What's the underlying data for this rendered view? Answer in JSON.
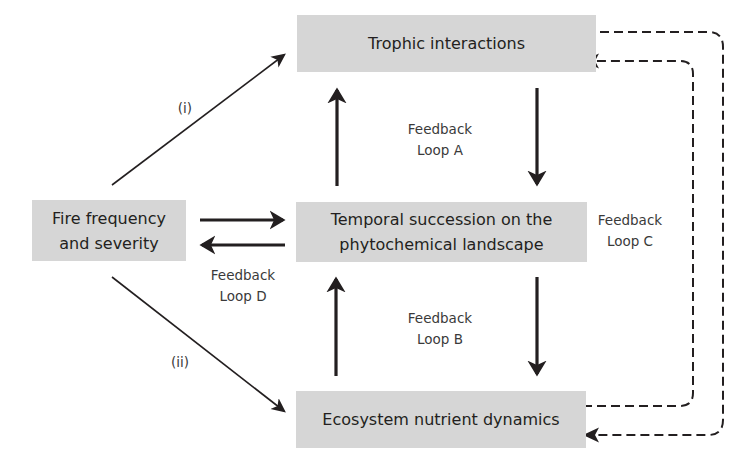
{
  "diagram": {
    "nodes": {
      "trophic": {
        "label": "Trophic interactions"
      },
      "temporal": {
        "line1": "Temporal succession on the",
        "line2": "phytochemical landscape"
      },
      "ecosystem": {
        "label": "Ecosystem nutrient dynamics"
      },
      "fire": {
        "line1": "Fire frequency",
        "line2": "and severity"
      }
    },
    "loops": {
      "a": {
        "line1": "Feedback",
        "line2": "Loop A"
      },
      "b": {
        "line1": "Feedback",
        "line2": "Loop B"
      },
      "c": {
        "line1": "Feedback",
        "line2": "Loop C"
      },
      "d": {
        "line1": "Feedback",
        "line2": "Loop D"
      }
    },
    "paths": {
      "i": "(i)",
      "ii": "(ii)"
    },
    "edges": [
      {
        "from": "fire",
        "to": "trophic",
        "label": "(i)",
        "style": "solid-thin"
      },
      {
        "from": "fire",
        "to": "ecosystem",
        "label": "(ii)",
        "style": "solid-thin"
      },
      {
        "from": "fire",
        "to": "temporal",
        "style": "solid-bold"
      },
      {
        "from": "temporal",
        "to": "fire",
        "style": "solid-bold",
        "loop": "D"
      },
      {
        "from": "temporal",
        "to": "trophic",
        "style": "solid-bold",
        "loop": "A"
      },
      {
        "from": "trophic",
        "to": "temporal",
        "style": "solid-bold",
        "loop": "A"
      },
      {
        "from": "ecosystem",
        "to": "temporal",
        "style": "solid-bold",
        "loop": "B"
      },
      {
        "from": "temporal",
        "to": "ecosystem",
        "style": "solid-bold",
        "loop": "B"
      },
      {
        "from": "trophic",
        "to": "ecosystem",
        "style": "dashed",
        "loop": "C"
      },
      {
        "from": "ecosystem",
        "to": "trophic",
        "style": "dashed",
        "loop": "C"
      }
    ],
    "colors": {
      "box_fill": "#d6d6d6",
      "text": "#231f20",
      "arrow": "#231f20"
    }
  }
}
